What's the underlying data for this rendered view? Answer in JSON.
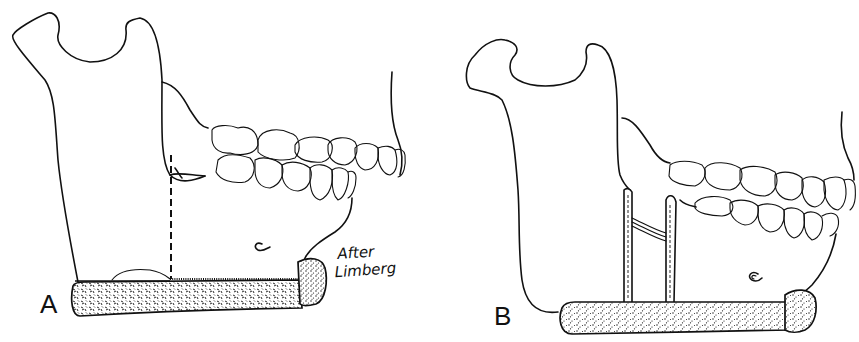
{
  "figure": {
    "panels": [
      {
        "label": "A",
        "description": "Mandible with graft bar along inferior border; dashed osteotomy line on ramus",
        "credit_line1": "After",
        "credit_line2": "Limberg"
      },
      {
        "label": "B",
        "description": "Mandible with graft bar and two vertical struts connected by wire"
      }
    ],
    "colors": {
      "ink": "#111111",
      "background": "#ffffff"
    }
  }
}
